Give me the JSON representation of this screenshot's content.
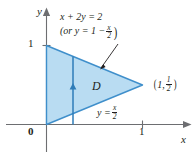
{
  "figure": {
    "background": "#ffffff",
    "axis_color": "#6d6e71",
    "region_fill": "#b9dcf2",
    "region_stroke": "#3f8fcb",
    "arrow_color": "#2f7cb8",
    "text_color": "#231f20"
  },
  "axes": {
    "y_label": "y",
    "x_label": "x",
    "origin_label": "0",
    "y_tick_label": "1",
    "x_tick_label": "1"
  },
  "region": {
    "label": "D",
    "vertices": [
      {
        "x": 0,
        "y": 0
      },
      {
        "x": 0,
        "y": 1
      },
      {
        "x": 1,
        "y": 0.5
      }
    ]
  },
  "annotations": {
    "upper_line_equation": "x + 2y = 2",
    "upper_line_alt_prefix": "(or y = 1 −",
    "upper_line_alt_num": "x",
    "upper_line_alt_den": "2",
    "upper_line_alt_suffix": ")",
    "lower_line_prefix": "y =",
    "lower_line_num": "x",
    "lower_line_den": "2",
    "point_open_paren": "(",
    "point_x": "1,",
    "point_y_num": "1",
    "point_y_den": "2",
    "point_close_paren": ")"
  }
}
